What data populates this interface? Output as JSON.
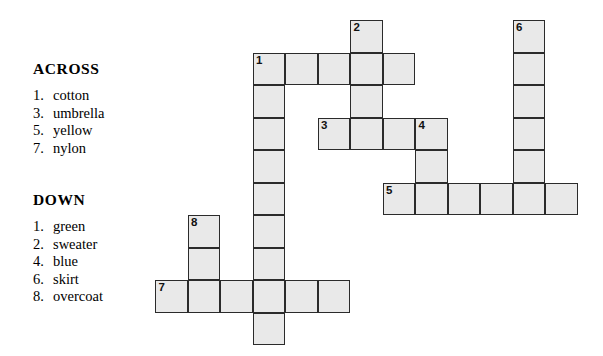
{
  "page": {
    "background_color": "#ffffff",
    "text_color": "#000000"
  },
  "clues": {
    "across": {
      "heading": "ACROSS",
      "items": [
        {
          "number": "1.",
          "text": "cotton"
        },
        {
          "number": "3.",
          "text": "umbrella"
        },
        {
          "number": "5.",
          "text": "yellow"
        },
        {
          "number": "7.",
          "text": "nylon"
        }
      ]
    },
    "down": {
      "heading": "DOWN",
      "items": [
        {
          "number": "1.",
          "text": "green"
        },
        {
          "number": "2.",
          "text": "sweater"
        },
        {
          "number": "4.",
          "text": "blue"
        },
        {
          "number": "6.",
          "text": "skirt"
        },
        {
          "number": "8.",
          "text": "overcoat"
        }
      ]
    }
  },
  "grid": {
    "cell_size": 32.5,
    "cell_fill_color": "#e9e9e9",
    "cell_border_color": "#2b2b2b",
    "origin_x": 155,
    "origin_y": 20,
    "numbered_cells": [
      {
        "number": "1",
        "col": 3,
        "row": 1
      },
      {
        "number": "2",
        "col": 6,
        "row": 0
      },
      {
        "number": "3",
        "col": 5,
        "row": 3
      },
      {
        "number": "4",
        "col": 8,
        "row": 3
      },
      {
        "number": "5",
        "col": 7,
        "row": 5
      },
      {
        "number": "6",
        "col": 11,
        "row": 0
      },
      {
        "number": "7",
        "col": 0,
        "row": 8
      },
      {
        "number": "8",
        "col": 1,
        "row": 6
      }
    ],
    "cells": [
      {
        "col": 6,
        "row": 0,
        "num": "2"
      },
      {
        "col": 11,
        "row": 0,
        "num": "6"
      },
      {
        "col": 3,
        "row": 1,
        "num": "1"
      },
      {
        "col": 4,
        "row": 1,
        "num": ""
      },
      {
        "col": 5,
        "row": 1,
        "num": ""
      },
      {
        "col": 6,
        "row": 1,
        "num": ""
      },
      {
        "col": 7,
        "row": 1,
        "num": ""
      },
      {
        "col": 11,
        "row": 1,
        "num": ""
      },
      {
        "col": 3,
        "row": 2,
        "num": ""
      },
      {
        "col": 6,
        "row": 2,
        "num": ""
      },
      {
        "col": 11,
        "row": 2,
        "num": ""
      },
      {
        "col": 3,
        "row": 3,
        "num": ""
      },
      {
        "col": 5,
        "row": 3,
        "num": "3"
      },
      {
        "col": 6,
        "row": 3,
        "num": ""
      },
      {
        "col": 7,
        "row": 3,
        "num": ""
      },
      {
        "col": 8,
        "row": 3,
        "num": "4"
      },
      {
        "col": 11,
        "row": 3,
        "num": ""
      },
      {
        "col": 3,
        "row": 4,
        "num": ""
      },
      {
        "col": 8,
        "row": 4,
        "num": ""
      },
      {
        "col": 11,
        "row": 4,
        "num": ""
      },
      {
        "col": 3,
        "row": 5,
        "num": ""
      },
      {
        "col": 7,
        "row": 5,
        "num": "5"
      },
      {
        "col": 8,
        "row": 5,
        "num": ""
      },
      {
        "col": 9,
        "row": 5,
        "num": ""
      },
      {
        "col": 10,
        "row": 5,
        "num": ""
      },
      {
        "col": 11,
        "row": 5,
        "num": ""
      },
      {
        "col": 12,
        "row": 5,
        "num": ""
      },
      {
        "col": 1,
        "row": 6,
        "num": "8"
      },
      {
        "col": 3,
        "row": 6,
        "num": ""
      },
      {
        "col": 1,
        "row": 7,
        "num": ""
      },
      {
        "col": 3,
        "row": 7,
        "num": ""
      },
      {
        "col": 0,
        "row": 8,
        "num": "7"
      },
      {
        "col": 1,
        "row": 8,
        "num": ""
      },
      {
        "col": 2,
        "row": 8,
        "num": ""
      },
      {
        "col": 3,
        "row": 8,
        "num": ""
      },
      {
        "col": 4,
        "row": 8,
        "num": ""
      },
      {
        "col": 5,
        "row": 8,
        "num": ""
      },
      {
        "col": 3,
        "row": 9,
        "num": ""
      }
    ]
  }
}
